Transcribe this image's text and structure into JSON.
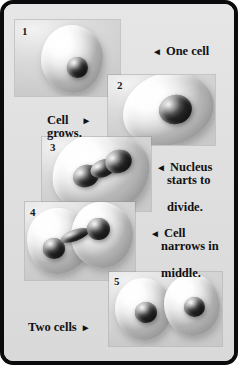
{
  "figure": {
    "title_fragment": "",
    "frame_color": "#0b0b0d",
    "background_color": "#e2e2e2",
    "panel_background": "#d9d9d9"
  },
  "panels": [
    {
      "number": "1",
      "caption": "One cell",
      "description": "round-cell-with-central-nucleus"
    },
    {
      "number": "2",
      "caption": "Cell grows.",
      "description": "enlarged-oval-cell-with-large-nucleus"
    },
    {
      "number": "3",
      "caption": "Nucleus starts to divide.",
      "description": "cell-with-dumbbell-shaped-dividing-nucleus"
    },
    {
      "number": "4",
      "caption": "Cell narrows in middle.",
      "description": "pinched-cell-with-two-separating-nuclei"
    },
    {
      "number": "5",
      "caption": "Two cells",
      "description": "two-separate-daughter-cells"
    }
  ],
  "labels": {
    "one_cell": {
      "arrow": "◄",
      "text": "One cell",
      "arrow_side": "left"
    },
    "cell_grows": {
      "line1": "Cell",
      "line2": "grows.",
      "arrow": "►",
      "arrow_side": "right"
    },
    "nucleus_divides": {
      "arrow": "◄",
      "line1": "Nucleus",
      "line2": "starts to",
      "line3": "divide.",
      "arrow_side": "left"
    },
    "cell_narrows": {
      "arrow": "◄",
      "line1": "Cell",
      "line2": "narrows in",
      "line3": "middle.",
      "arrow_side": "left"
    },
    "two_cells": {
      "text": "Two cells",
      "arrow": "►",
      "arrow_side": "right"
    }
  }
}
